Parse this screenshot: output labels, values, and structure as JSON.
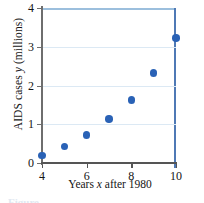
{
  "chart_data": {
    "type": "scatter",
    "title": "",
    "xlabel": "Years x after 1980",
    "xlabel_parts": {
      "pre": "Years ",
      "italic": "x",
      "post": " after 1980"
    },
    "ylabel": "AIDS cases y (millions)",
    "ylabel_parts": {
      "pre": "AIDS cases ",
      "italic": "y",
      "post": " (millions)"
    },
    "xlim": [
      4,
      10
    ],
    "ylim": [
      0,
      4
    ],
    "xticks": [
      4,
      6,
      8,
      10
    ],
    "xtick_labels": [
      "4",
      "6",
      "8",
      "10"
    ],
    "yticks": [
      0,
      1,
      2,
      3,
      4
    ],
    "ytick_labels": [
      "0",
      "1",
      "2",
      "3",
      "4"
    ],
    "grid": "horizontal",
    "legend": "none",
    "x": [
      4,
      5,
      6,
      7,
      8,
      9,
      10
    ],
    "values": [
      0.2,
      0.42,
      0.72,
      1.13,
      1.62,
      2.32,
      3.22
    ],
    "points": [
      {
        "x": 4,
        "y": 0.2
      },
      {
        "x": 5,
        "y": 0.42
      },
      {
        "x": 6,
        "y": 0.72
      },
      {
        "x": 7,
        "y": 1.13
      },
      {
        "x": 8,
        "y": 1.62
      },
      {
        "x": 9,
        "y": 2.32
      },
      {
        "x": 10,
        "y": 3.22
      }
    ],
    "colors": {
      "marker": "#2a62b6",
      "grid": "#dce9f4",
      "axis": "#6e6e6e",
      "frame_top": "#9cbfdd",
      "frame_right": "#4f79b5"
    }
  },
  "caption": {
    "text": "Figure"
  }
}
